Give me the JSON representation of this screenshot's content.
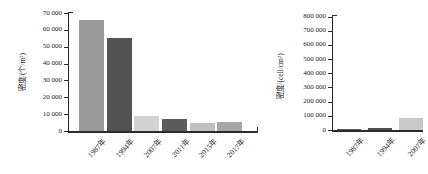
{
  "page": {
    "background": "#ffffff",
    "axis_color": "#2b2b2b",
    "text_color": "#1c1c1c"
  },
  "chart_data": [
    {
      "type": "bar",
      "title": "",
      "xlabel": "",
      "ylabel": "密度/(个/m²)",
      "categories": [
        "1987年",
        "1994年",
        "2007年",
        "2011年",
        "2015年",
        "2017年"
      ],
      "values": [
        66000,
        55000,
        9000,
        7000,
        4500,
        5500
      ],
      "ylim": [
        0,
        70000
      ],
      "ytick_values": [
        0,
        10000,
        20000,
        30000,
        40000,
        50000,
        60000,
        70000
      ],
      "ytick_labels": [
        "0",
        "10 000",
        "20 000",
        "30 000",
        "40 000",
        "50 000",
        "60 000",
        "70 000"
      ],
      "bar_colors": [
        "#9a9a9a",
        "#525252",
        "#d3d3d3",
        "#5c5c5c",
        "#c0c0c0",
        "#a6a6a6"
      ],
      "grid": false,
      "legend": null
    },
    {
      "type": "bar",
      "title": "",
      "xlabel": "",
      "ylabel": "密度/(cell/cm²)",
      "categories": [
        "1987年",
        "1994年",
        "2007年"
      ],
      "values": [
        2000,
        12000,
        85000
      ],
      "ylim": [
        0,
        800000
      ],
      "ytick_values": [
        0,
        100000,
        200000,
        300000,
        400000,
        500000,
        600000,
        700000,
        800000
      ],
      "ytick_labels": [
        "0",
        "100 000",
        "200 000",
        "300 000",
        "400 000",
        "500 000",
        "600 000",
        "700 000",
        "800 000"
      ],
      "bar_colors": [
        "#5c5c5c",
        "#4f4f4f",
        "#c9c9c9"
      ],
      "grid": false,
      "legend": null
    }
  ]
}
